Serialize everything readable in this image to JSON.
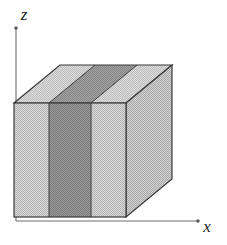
{
  "figure": {
    "background_color": "#ffffff",
    "width": 227,
    "height": 245
  },
  "axes": {
    "z_axis": {
      "label": "z",
      "label_x": 24,
      "label_y": 20,
      "line_color": "#6e6e6e",
      "x": 16,
      "y_bottom": 221,
      "y_top": 28
    },
    "x_axis": {
      "label": "x",
      "label_x": 207,
      "label_y": 232,
      "line_color": "#6e6e6e",
      "y": 221,
      "x_left": 16,
      "x_right": 198
    }
  },
  "solid": {
    "name": "layered-slab",
    "front_face": {
      "left": 14,
      "right": 126,
      "top": 103,
      "bottom": 217
    },
    "depth_offset": {
      "dx": 46,
      "dy": -38
    },
    "edge_color": "#3a3a3a",
    "layers": [
      {
        "name": "left-light-layer",
        "x_start": 14,
        "x_end": 49,
        "shade": "light",
        "color": "#c6c6c6"
      },
      {
        "name": "center-dark-layer",
        "x_start": 49,
        "x_end": 91,
        "shade": "dark",
        "color": "#8b8b8b"
      },
      {
        "name": "right-light-layer",
        "x_start": 91,
        "x_end": 126,
        "shade": "light",
        "color": "#c6c6c6"
      }
    ],
    "faces": {
      "front": {
        "color": "#c6c6c6",
        "dark_color": "#8b8b8b"
      },
      "top": {
        "color": "#cdcdcd",
        "dark_color": "#949494"
      },
      "right": {
        "color": "#bdbdbd"
      }
    }
  },
  "colors": {
    "light_gray": "#c6c6c6",
    "dark_gray": "#8b8b8b",
    "top_light_gray": "#cdcdcd",
    "top_dark_gray": "#949494",
    "side_gray": "#bdbdbd",
    "edge": "#3a3a3a",
    "axis": "#6e6e6e",
    "text": "#1a1a1a"
  }
}
